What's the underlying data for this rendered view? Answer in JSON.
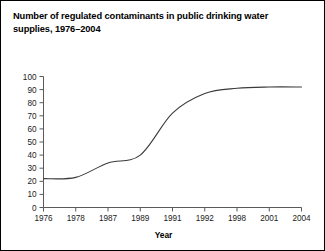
{
  "figure": {
    "title": "Number of regulated contaminants in public drinking water supplies, 1976–2004",
    "border_color": "#000000",
    "background_color": "#ffffff"
  },
  "chart_data": {
    "type": "line",
    "title": "Number of regulated contaminants in public drinking water supplies, 1976–2004",
    "xlabel": "Year",
    "ylabel": "",
    "categories": [
      "1976",
      "1978",
      "1987",
      "1989",
      "1991",
      "1992",
      "1998",
      "2001",
      "2004"
    ],
    "values": [
      22,
      23,
      34,
      40,
      72,
      87,
      91,
      92,
      92
    ],
    "series": [
      {
        "name": "Regulated contaminants",
        "values": [
          22,
          23,
          34,
          40,
          72,
          87,
          91,
          92,
          92
        ],
        "color": "#3a3a3a"
      }
    ],
    "ylim": [
      0,
      100
    ],
    "yticks": [
      0,
      10,
      20,
      30,
      40,
      50,
      60,
      70,
      80,
      90,
      100
    ],
    "ytick_labels": [
      "0",
      "10",
      "20",
      "30",
      "40",
      "50",
      "60",
      "70",
      "80",
      "90",
      "100"
    ],
    "xtick_labels": [
      "1976",
      "1978",
      "1987",
      "1989",
      "1991",
      "1992",
      "1998",
      "2001",
      "2004"
    ],
    "grid": false,
    "legend": false,
    "line_color": "#3a3a3a",
    "axis_color": "#5a5a5a",
    "smoothing": "spline"
  },
  "axes": {
    "x_title": "Year"
  }
}
